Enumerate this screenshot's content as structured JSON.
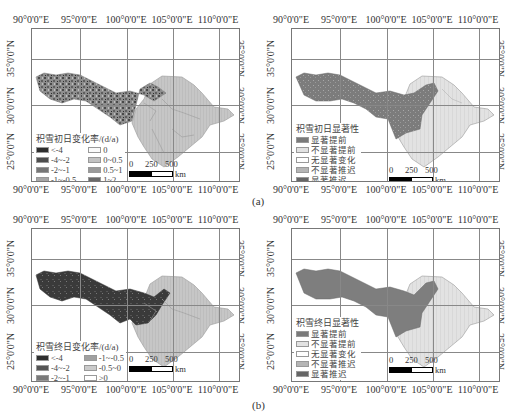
{
  "figure": {
    "captions": [
      "(a)",
      "(b)"
    ],
    "x_ticks": [
      "90°0'0\"E",
      "95°0'0\"E",
      "100°0'0\"E",
      "105°0'0\"E",
      "110°0'0\"E"
    ],
    "y_ticks": [
      "35°0'0\"N",
      "30°0'0\"N",
      "25°0'0\"N"
    ],
    "scale_bar": {
      "labels": [
        "0",
        "250",
        "500"
      ],
      "unit": "km"
    },
    "colors": {
      "basin_light": "#c9c9c9",
      "dark1": "#3a3a3a",
      "dark2": "#5a5a5a",
      "mid": "#8a8a8a",
      "light_hatch": "#dcdcdc",
      "grid": "#888888"
    }
  },
  "panels": {
    "a_left": {
      "legend_title": "积雪初日变化率/(d/a)",
      "legend_col1": [
        "<-4",
        "-4~-2",
        "-2~-1",
        "-1~-0.5",
        "-0.5~0"
      ],
      "legend_col2": [
        "0",
        "0~0.5",
        "0.5~1",
        "1~2",
        ">2"
      ]
    },
    "a_right": {
      "legend_title": "积雪初日显著性",
      "legend_items": [
        "显著提前",
        "不显著提前",
        "无显著变化",
        "不显著推迟",
        "显著推迟"
      ]
    },
    "b_left": {
      "legend_title": "积雪终日变化率/(d/a)",
      "legend_col1": [
        "<-4",
        "-4~-2",
        "-2~-1"
      ],
      "legend_col2": [
        "-1~-0.5",
        "-0.5~0",
        ">0"
      ]
    },
    "b_right": {
      "legend_title": "积雪终日显著性",
      "legend_items": [
        "显著提前",
        "不显著提前",
        "无显著变化",
        "不显著推迟",
        "显著推迟"
      ]
    }
  }
}
